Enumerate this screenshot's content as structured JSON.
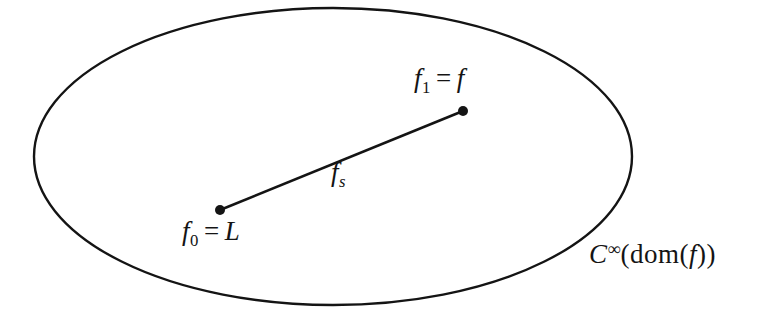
{
  "diagram": {
    "background_color": "#ffffff",
    "ink_color": "#141414",
    "labels": {
      "f1": {
        "base": "f",
        "sub": "1",
        "equals": "=",
        "value": "f"
      },
      "f0": {
        "base": "f",
        "sub": "0",
        "equals": "=",
        "value": "L"
      },
      "segment": {
        "base": "f",
        "sub": "s"
      },
      "space": {
        "c": "C",
        "sup": "∞",
        "mid": "(dom(",
        "arg": "f",
        "close": "))"
      }
    }
  }
}
